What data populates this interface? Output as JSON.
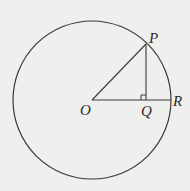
{
  "diagram": {
    "labels": {
      "O": "O",
      "P": "P",
      "Q": "Q",
      "R": "R"
    },
    "colors": {
      "background": "#efefed",
      "stroke": "#3a3a3a"
    },
    "geometry": {
      "center": [
        92,
        100
      ],
      "radius": 79,
      "P": [
        146,
        44
      ],
      "Q": [
        146,
        100
      ],
      "R": [
        171,
        100
      ]
    }
  }
}
